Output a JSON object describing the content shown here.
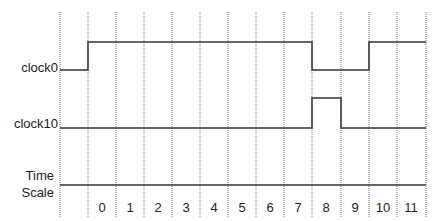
{
  "diagram": {
    "type": "timing-diagram",
    "signals": [
      {
        "name": "clock0",
        "levels": [
          "low",
          "high",
          "high",
          "high",
          "high",
          "high",
          "high",
          "high",
          "high",
          "low",
          "low",
          "high",
          "high"
        ]
      },
      {
        "name": "clock10",
        "levels": [
          "low",
          "low",
          "low",
          "low",
          "low",
          "low",
          "low",
          "low",
          "low",
          "high",
          "low",
          "low",
          "low"
        ]
      }
    ],
    "time_scale": {
      "label_line1": "Time",
      "label_line2": "Scale",
      "ticks": [
        "0",
        "1",
        "2",
        "3",
        "4",
        "5",
        "6",
        "7",
        "8",
        "9",
        "10",
        "11"
      ]
    }
  }
}
